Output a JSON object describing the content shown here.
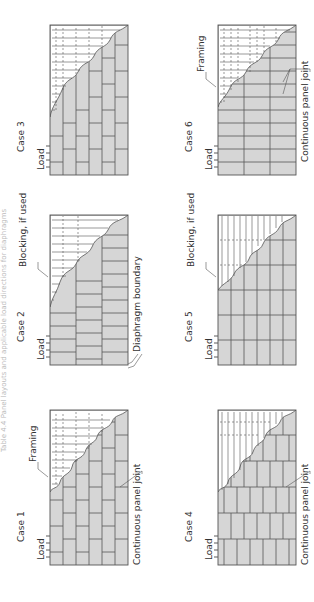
{
  "figure": {
    "orientation": "rotated-90-ccw",
    "title_faint": "Table 4.4 Panel layouts and applicable load directions for diaphragms",
    "colors": {
      "sheathing": "#d6d6d6",
      "lines": "#555555",
      "text": "#333333",
      "background": "#ffffff"
    },
    "cases": [
      {
        "id": "case1",
        "label": "Case 1",
        "load_label": "Load",
        "callouts": [
          "Framing",
          "Continuous panel joint"
        ],
        "layout": "staggered horizontal panels",
        "framing": "vertical with dashed blocking"
      },
      {
        "id": "case2",
        "label": "Case 2",
        "load_label": "Load",
        "callouts": [
          "Blocking, if used",
          "Diaphragm boundary"
        ],
        "layout": "staggered horizontal panels",
        "framing": "vertical"
      },
      {
        "id": "case3",
        "label": "Case 3",
        "load_label": "Load",
        "callouts": [],
        "layout": "staggered horizontal panels",
        "framing": "vertical with dashed blocking"
      },
      {
        "id": "case4",
        "label": "Case 4",
        "load_label": "Load",
        "callouts": [
          "Continuous panel joint"
        ],
        "layout": "staggered vertical panels",
        "framing": "horizontal"
      },
      {
        "id": "case5",
        "label": "Case 5",
        "load_label": "Load",
        "callouts": [
          "Blocking, if used"
        ],
        "layout": "continuous grid",
        "framing": "horizontal"
      },
      {
        "id": "case6",
        "label": "Case 6",
        "load_label": "Load",
        "callouts": [
          "Framing",
          "Continuous panel joint"
        ],
        "layout": "continuous vertical joints",
        "framing": "vertical with dashed blocking"
      }
    ]
  }
}
